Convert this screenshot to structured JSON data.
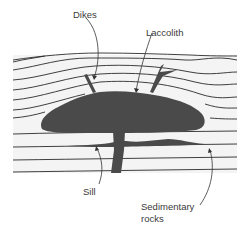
{
  "diagram": {
    "labels": {
      "dikes": "Dikes",
      "laccolith": "Laccolith",
      "sill": "Sill",
      "sedimentary_line1": "Sedimentary",
      "sedimentary_line2": "rocks"
    },
    "colors": {
      "intrusion": "#4a4a4a",
      "strata_fill": "#f4f4f4",
      "strata_line": "#2a2a2a",
      "leader": "#333333",
      "text": "#3a3a3a"
    }
  }
}
